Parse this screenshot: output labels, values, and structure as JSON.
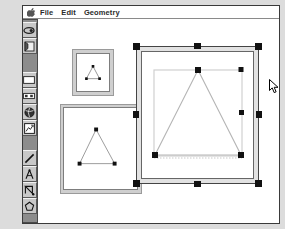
{
  "app": {
    "title": "Geometry",
    "background_color": "#dcdcdc",
    "window_bg": "#ffffff",
    "palette_color": "#8c8c8c",
    "accent_color": "#000000"
  },
  "menubar": {
    "apple_icon": "apple-icon",
    "items": [
      {
        "label": "File"
      },
      {
        "label": "Edit"
      },
      {
        "label": "Geometry"
      }
    ]
  },
  "palette": {
    "groups": [
      {
        "name": "selection-tools",
        "tools": [
          {
            "icon": "arrow-pointer-icon",
            "selected": true
          },
          {
            "icon": "lasso-icon",
            "selected": false
          },
          {
            "icon": "trash-can-icon",
            "selected": false
          },
          {
            "icon": "page-flag-icon",
            "selected": false
          }
        ]
      },
      {
        "name": "construction-tools",
        "tools": [
          {
            "icon": "stone-shape-icon",
            "selected": false
          },
          {
            "icon": "blank-panel-icon",
            "selected": false
          },
          {
            "icon": "camera-icon",
            "selected": false
          },
          {
            "icon": "spectacles-icon",
            "selected": false
          },
          {
            "icon": "paint-bucket-icon",
            "selected": false
          },
          {
            "icon": "globe-icon",
            "selected": false
          },
          {
            "icon": "table-grid-icon",
            "selected": false
          },
          {
            "icon": "chart-page-icon",
            "selected": false
          },
          {
            "icon": "pencil-icon",
            "selected": false
          }
        ]
      },
      {
        "name": "geometry-tools",
        "tools": [
          {
            "icon": "point-icon",
            "selected": false
          },
          {
            "icon": "line-segment-icon",
            "selected": false
          },
          {
            "icon": "polygon-vertices-icon",
            "selected": false
          },
          {
            "icon": "compass-icon",
            "selected": false
          },
          {
            "icon": "circle-icon",
            "selected": false
          },
          {
            "icon": "measure-icon",
            "selected": false
          },
          {
            "icon": "angle-icon",
            "selected": false
          },
          {
            "icon": "pentagon-icon",
            "selected": false
          }
        ]
      }
    ]
  },
  "documents": [
    {
      "name": "small-preview-window",
      "shape": "triangle",
      "vertices_visible": true,
      "selected": false,
      "handle_count": 3
    },
    {
      "name": "medium-document-window",
      "shape": "triangle",
      "vertices_visible": true,
      "selected": true,
      "handle_count": 3
    },
    {
      "name": "large-document-window",
      "shape": "triangle",
      "vertices_visible": true,
      "selected": true,
      "handle_count": 3,
      "bounding_box": true,
      "resize_handles": 8
    }
  ],
  "cursor": {
    "name": "arrow-cursor",
    "x": 246,
    "y": 60
  }
}
